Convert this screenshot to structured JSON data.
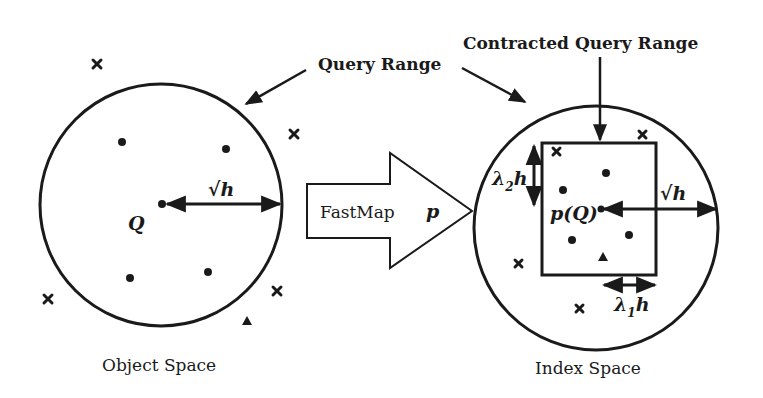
{
  "figure": {
    "left_panel": {
      "caption": "Object Space",
      "center_label": "Q",
      "radius_label": "√h",
      "circle": {
        "cx": 161,
        "cy": 205,
        "r": 121
      }
    },
    "transform_arrow": {
      "label_main": "FastMap",
      "label_symbol": "p"
    },
    "right_panel": {
      "caption": "Index Space",
      "center_label": "p(Q)",
      "radius_label": "√h",
      "vertical_extent_label": "λ",
      "vertical_extent_sub": "2",
      "vertical_extent_suffix": "h",
      "horizontal_extent_label": "λ",
      "horizontal_extent_sub": "1",
      "horizontal_extent_suffix": "h",
      "circle": {
        "cx": 596,
        "cy": 228,
        "r": 122
      },
      "rectangle": {
        "x": 542,
        "y": 143,
        "w": 114,
        "h": 132
      }
    },
    "callouts": {
      "query_range": "Query Range",
      "contracted_query_range": "Contracted Query Range"
    },
    "legend_markers": {
      "dot": "data object inside range",
      "cross": "data object outside range",
      "triangle": "false positive object"
    },
    "colors": {
      "ink": "#1a1a1a",
      "background": "#ffffff"
    }
  }
}
